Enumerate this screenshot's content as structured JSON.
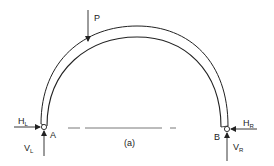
{
  "figure": {
    "caption": "(a)"
  },
  "load": {
    "label": "P"
  },
  "supports": {
    "left": {
      "label": "A",
      "horizontal_reaction": {
        "main": "H",
        "sub": "L"
      },
      "vertical_reaction": {
        "main": "V",
        "sub": "L"
      }
    },
    "right": {
      "label": "B",
      "horizontal_reaction": {
        "main": "H",
        "sub": "R"
      },
      "vertical_reaction": {
        "main": "V",
        "sub": "R"
      }
    }
  },
  "colors": {
    "line": "#222222",
    "background": "#ffffff",
    "dash": "#555555"
  }
}
